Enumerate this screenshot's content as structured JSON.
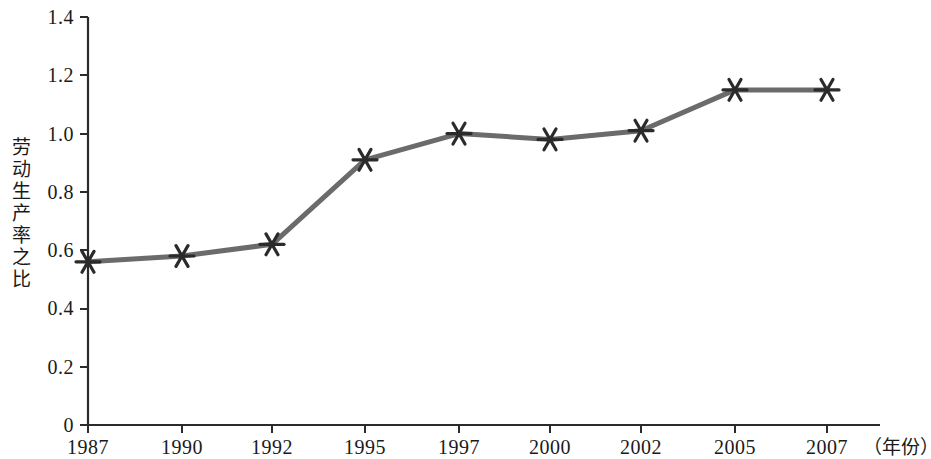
{
  "chart_data": {
    "type": "line",
    "title": "",
    "subtitle": "",
    "xlabel": "（年份）",
    "ylabel": "劳动生产率之比",
    "categories": [
      "1987",
      "1990",
      "1992",
      "1995",
      "1997",
      "2000",
      "2002",
      "2005",
      "2007"
    ],
    "series": [
      {
        "name": "劳动生产率之比",
        "values": [
          0.56,
          0.58,
          0.62,
          0.91,
          1.0,
          0.98,
          1.01,
          1.15,
          1.15
        ]
      }
    ],
    "ylim": [
      0,
      1.4
    ],
    "ytick_labels": [
      "0",
      "0.2",
      "0.4",
      "0.6",
      "0.8",
      "1.0",
      "1.2",
      "1.4"
    ],
    "ytick_values": [
      0,
      0.2,
      0.4,
      0.6,
      0.8,
      1.0,
      1.2,
      1.4
    ],
    "grid": false,
    "legend": "none",
    "marker": "six-point-asterisk",
    "line_color": "#6b6b6b",
    "marker_color": "#2b2b2b",
    "axis_color": "#2b2b2b"
  },
  "axes": {
    "y_title": "劳动生产率之比",
    "x_unit": "（年份）"
  }
}
